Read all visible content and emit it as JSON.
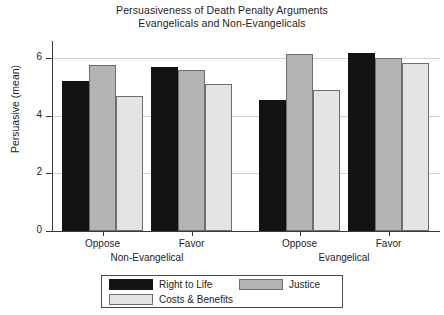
{
  "chart_data": {
    "type": "bar",
    "title": "Persuasiveness of Death Penalty Arguments",
    "subtitle": "Evangelicals and Non-Evangelicals",
    "xlabel": "",
    "ylabel": "Persuasive (mean)",
    "ylim": [
      0,
      6.6
    ],
    "yticks": [
      0,
      2,
      4,
      6
    ],
    "ytick_labels": [
      "0",
      "2",
      "4",
      "6"
    ],
    "grid": "horizontal",
    "legend_position": "bottom-center",
    "categories": [
      "Oppose",
      "Favor",
      "Oppose",
      "Favor"
    ],
    "group_labels": [
      "Non-Evangelical",
      "Evangelical"
    ],
    "series": [
      {
        "name": "Right to Life",
        "color": "#131313",
        "values": [
          5.2,
          5.7,
          4.55,
          6.2
        ]
      },
      {
        "name": "Justice",
        "color": "#b4b4b4",
        "values": [
          5.75,
          5.6,
          6.15,
          6.0
        ]
      },
      {
        "name": "Costs & Benefits",
        "color": "#e4e4e4",
        "values": [
          4.7,
          5.1,
          4.9,
          5.85
        ]
      }
    ]
  },
  "legend": {
    "items": [
      {
        "label": "Right to Life"
      },
      {
        "label": "Justice"
      },
      {
        "label": "Costs & Benefits"
      }
    ]
  }
}
